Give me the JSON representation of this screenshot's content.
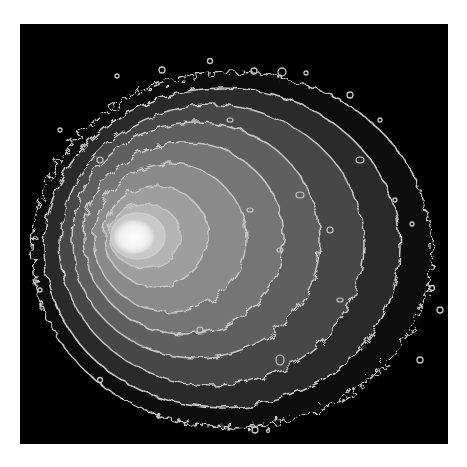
{
  "image": {
    "description": "Grayscale astronomical intensity map with overlaid contour lines",
    "background_color": "#000000",
    "page_color": "#ffffff",
    "contour_color": "#c8c8c8",
    "levels": [
      {
        "level": 1,
        "fill": "#2a2a2a"
      },
      {
        "level": 2,
        "fill": "#474747"
      },
      {
        "level": 3,
        "fill": "#5f5f5f"
      },
      {
        "level": 4,
        "fill": "#757575"
      },
      {
        "level": 5,
        "fill": "#8a8a8a"
      },
      {
        "level": 6,
        "fill": "#9e9e9e"
      },
      {
        "level": 7,
        "fill": "#b4b4b4"
      },
      {
        "level": 8,
        "fill": "#f4f4f4"
      }
    ],
    "peak": {
      "x": 132,
      "y": 237
    }
  }
}
